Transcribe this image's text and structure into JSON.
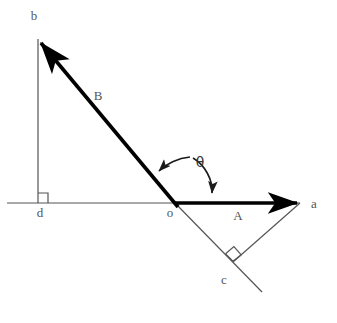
{
  "figure": {
    "type": "vector-decomposition-diagram",
    "background_color": "#ffffff",
    "stroke_color_thick": "#000000",
    "stroke_color_thin": "#555555",
    "label_color": "#555555",
    "width": 337,
    "height": 323
  },
  "points": {
    "o": {
      "label": "o",
      "x": 175,
      "y": 203,
      "label_x": 170,
      "label_y": 217
    },
    "a": {
      "label": "a",
      "x": 300,
      "y": 203,
      "label_x": 314,
      "label_y": 208
    },
    "b": {
      "label": "b",
      "x": 38,
      "y": 39,
      "label_x": 34,
      "label_y": 20
    },
    "c": {
      "label": "c",
      "x": 233,
      "y": 262,
      "label_x": 224,
      "label_y": 284
    },
    "d": {
      "label": "d",
      "x": 38,
      "y": 203,
      "label_x": 40,
      "label_y": 217
    }
  },
  "vectors": [
    {
      "name": "A",
      "label": "A",
      "label_x": 238,
      "label_y": 220,
      "from": "o",
      "to": "a",
      "style": "thick-arrow",
      "description": "horizontal vector A from origin o pointing right to a"
    },
    {
      "name": "B",
      "label": "B",
      "label_x": 98,
      "label_y": 100,
      "from": "o",
      "to": "b",
      "style": "thick-arrow",
      "description": "vector B from origin o pointing up-left to b"
    }
  ],
  "construction_lines": [
    {
      "name": "axis-line",
      "from_x": 7,
      "from_y": 203,
      "to_x": 300,
      "to_y": 203,
      "style": "thin",
      "description": "horizontal reference axis through d, o, toward a"
    },
    {
      "name": "bd-perpendicular",
      "from_x": 38,
      "from_y": 39,
      "to_x": 38,
      "to_y": 203,
      "style": "thin",
      "description": "vertical dropped from b to d on the axis"
    },
    {
      "name": "oc-extension",
      "from_x": 175,
      "from_y": 203,
      "to_x": 262,
      "to_y": 292,
      "style": "thin",
      "description": "line through origin opposite to B, passing through c"
    },
    {
      "name": "ac-perpendicular",
      "from_x": 300,
      "from_y": 203,
      "to_x": 233,
      "to_y": 262,
      "style": "thin",
      "description": "segment from a perpendicular to line oc, meeting at c"
    }
  ],
  "right_angle_marks": [
    {
      "name": "right-angle-at-d",
      "x": 38,
      "y": 203,
      "size": 10,
      "description": "right angle between bd and the axis at d"
    },
    {
      "name": "right-angle-at-c",
      "x": 233,
      "y": 262,
      "size": 11,
      "description": "right angle between ac and line oc at c"
    }
  ],
  "angle_arc": {
    "name": "theta-arc",
    "symbol": "θ",
    "label_x": 200,
    "label_y": 167,
    "center_x": 175,
    "center_y": 203,
    "radius": 46,
    "from_arrow": {
      "x": 156,
      "y": 173
    },
    "to_arrow": {
      "x": 212,
      "y": 199
    },
    "description": "double-headed arc marking angle theta measured from vector A to vector B"
  }
}
